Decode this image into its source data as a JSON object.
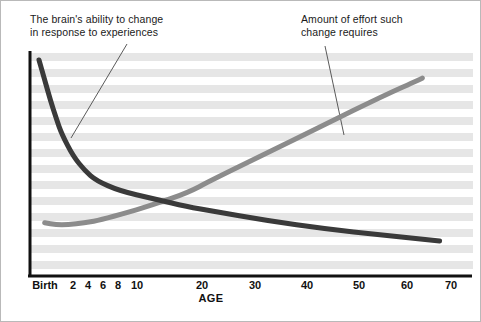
{
  "figure": {
    "width": 481,
    "height": 322,
    "background": "#ffffff",
    "border_color": "#b9b9b9"
  },
  "annotations": {
    "left": {
      "text": "The brain's ability to change\nin response to experiences",
      "leader_from": [
        126,
        43
      ],
      "leader_to": [
        70,
        137
      ]
    },
    "right": {
      "text": "Amount of effort such\nchange requires",
      "leader_from": [
        324,
        45
      ],
      "leader_to": [
        343,
        134
      ]
    }
  },
  "axis": {
    "title": "AGE",
    "ticks": [
      {
        "label": "Birth",
        "x": 44
      },
      {
        "label": "2",
        "x": 72
      },
      {
        "label": "4",
        "x": 87
      },
      {
        "label": "6",
        "x": 102
      },
      {
        "label": "8",
        "x": 117
      },
      {
        "label": "10",
        "x": 136
      },
      {
        "label": "20",
        "x": 201
      },
      {
        "label": "30",
        "x": 254
      },
      {
        "label": "40",
        "x": 306
      },
      {
        "label": "50",
        "x": 358
      },
      {
        "label": "60",
        "x": 406
      },
      {
        "label": "70",
        "x": 450
      }
    ],
    "axis_color": "#111111",
    "x_axis_y": 274,
    "y_axis_x": 28,
    "plot_top": 50,
    "plot_right": 472
  },
  "bands": {
    "color": "#e6e6e6",
    "band_height": 8,
    "gap_height": 8,
    "start_y": 52,
    "count": 14
  },
  "chart_data": {
    "type": "line",
    "title": "",
    "subtitle": "",
    "xlabel": "AGE",
    "ylabel": "",
    "grid": "horizontal-bands",
    "legend": "annotated-callouts",
    "xlim": [
      0,
      72
    ],
    "ylim": [
      0,
      100
    ],
    "xticks": [
      "Birth",
      "2",
      "4",
      "6",
      "8",
      "10",
      "20",
      "30",
      "40",
      "50",
      "60",
      "70"
    ],
    "series": [
      {
        "name": "The brain's ability to change in response to experiences",
        "color": "#3a3a3a",
        "stroke_width": 5,
        "shape": "decaying-curve",
        "points": [
          [
            0,
            98
          ],
          [
            1,
            88
          ],
          [
            2,
            78
          ],
          [
            3,
            69
          ],
          [
            4,
            61
          ],
          [
            6,
            50
          ],
          [
            8,
            43
          ],
          [
            10,
            38
          ],
          [
            14,
            33
          ],
          [
            20,
            29
          ],
          [
            26,
            25
          ],
          [
            30,
            23
          ],
          [
            40,
            18
          ],
          [
            50,
            14
          ],
          [
            60,
            11
          ],
          [
            70,
            8
          ]
        ]
      },
      {
        "name": "Amount of effort such change requires",
        "color": "#8c8c8c",
        "stroke_width": 5,
        "shape": "rising-curve",
        "points": [
          [
            1,
            17
          ],
          [
            3,
            16
          ],
          [
            5,
            16
          ],
          [
            8,
            17
          ],
          [
            10,
            18
          ],
          [
            14,
            21
          ],
          [
            20,
            26
          ],
          [
            26,
            32
          ],
          [
            30,
            38
          ],
          [
            40,
            52
          ],
          [
            50,
            66
          ],
          [
            60,
            80
          ],
          [
            67,
            89
          ]
        ]
      }
    ],
    "crossing_point": {
      "x": 27,
      "y": 25,
      "px": [
        217,
        208
      ]
    },
    "annotations": [
      "The brain's ability to change in response to experiences",
      "Amount of effort such change requires"
    ]
  }
}
